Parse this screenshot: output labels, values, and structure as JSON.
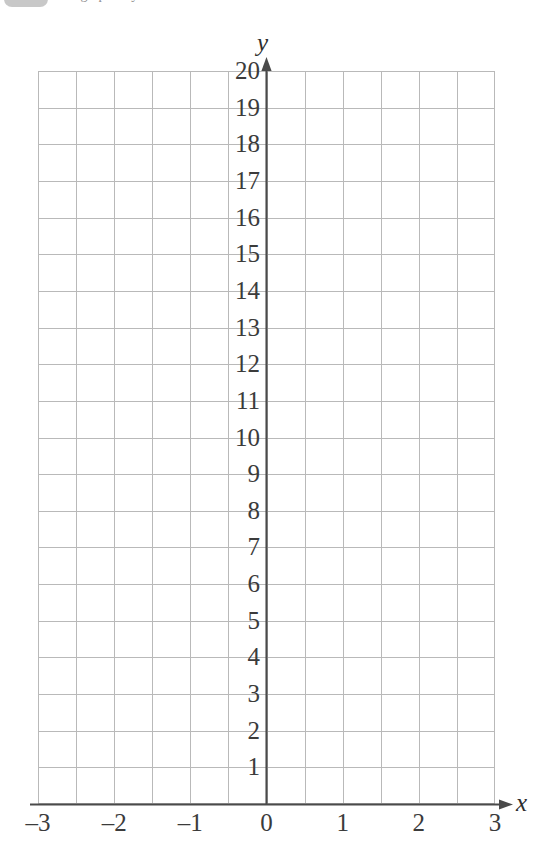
{
  "header": {
    "clipped_badge": "badge-fragment",
    "clipped_text": "the graph of y ="
  },
  "chart_data": {
    "type": "line",
    "title": "",
    "subtitle": "",
    "xlabel": "x",
    "ylabel": "y",
    "xlim": [
      -3,
      3
    ],
    "ylim": [
      0,
      20
    ],
    "x_tick_labels": [
      "–3",
      "–2",
      "–1",
      "0",
      "1",
      "2",
      "3"
    ],
    "x_tick_values": [
      -3,
      -2,
      -1,
      0,
      1,
      2,
      3
    ],
    "y_tick_labels": [
      "1",
      "2",
      "3",
      "4",
      "5",
      "6",
      "7",
      "8",
      "9",
      "10",
      "11",
      "12",
      "13",
      "14",
      "15",
      "16",
      "17",
      "18",
      "19",
      "20"
    ],
    "y_tick_values": [
      1,
      2,
      3,
      4,
      5,
      6,
      7,
      8,
      9,
      10,
      11,
      12,
      13,
      14,
      15,
      16,
      17,
      18,
      19,
      20
    ],
    "grid": true,
    "grid_step_x": 0.5,
    "grid_step_y": 1,
    "grid_columns": 12,
    "grid_rows": 20,
    "legend": null,
    "series": [],
    "annotations": [],
    "axis_arrow_x": true,
    "axis_arrow_y": true,
    "origin_label": "0",
    "colors": {
      "grid": "#b9b9b9",
      "axis": "#4a4a4a",
      "label": "#3b3b3b",
      "background": "#ffffff"
    }
  }
}
